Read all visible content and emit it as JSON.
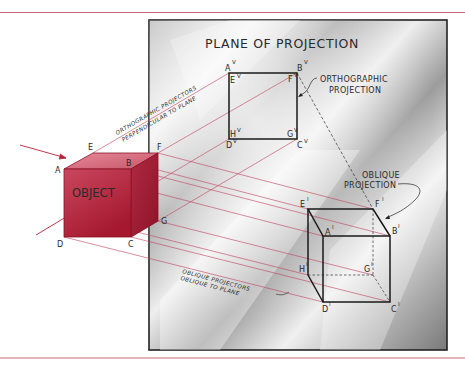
{
  "figure": {
    "type": "orthographic-vs-oblique-projection-diagram",
    "colors": {
      "accent_red": "#b8223a",
      "rule_line": "#c96a78",
      "projector_line": "#c0405a",
      "plane_border": "#222222",
      "ink": "#2a2a2a"
    },
    "plane": {
      "title": "PLANE OF PROJECTION"
    },
    "object": {
      "label": "OBJECT",
      "vertices": {
        "A": "A",
        "B": "B",
        "C": "C",
        "D": "D",
        "E": "E",
        "F": "F",
        "G": "G"
      }
    },
    "orthographic": {
      "callout_line1": "ORTHOGRAPHIC",
      "callout_line2": "PROJECTION",
      "projectors_line1": "ORTHOGRAPHIC PROJECTORS",
      "projectors_line2": "PERPENDICULAR TO PLANE",
      "vertices": {
        "A": "A",
        "B": "B",
        "C": "C",
        "D": "D",
        "E": "E",
        "F": "F",
        "G": "G",
        "H": "H"
      },
      "superscript": "V"
    },
    "oblique": {
      "callout_line1": "OBLIQUE",
      "callout_line2": "PROJECTION",
      "projectors_line1": "OBLIQUE PROJECTORS",
      "projectors_line2": "OBLIQUE TO PLANE",
      "vertices": {
        "A": "A",
        "B": "B",
        "C": "C",
        "D": "D",
        "E": "E",
        "F": "F",
        "G": "G",
        "H": "H"
      },
      "superscript": "I"
    }
  }
}
